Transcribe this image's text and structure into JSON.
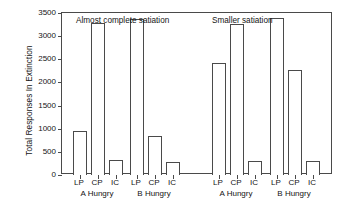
{
  "chart_data": {
    "type": "bar",
    "title": "",
    "xlabel": "",
    "ylabel": "Total Responses In Extinction",
    "ylim": [
      0,
      3500
    ],
    "yticks": [
      0,
      500,
      1000,
      1500,
      2000,
      2500,
      3000,
      3500
    ],
    "ytick_labels": [
      "0",
      "500",
      "1000",
      "1500",
      "2000",
      "2500",
      "3000",
      "3500"
    ],
    "grid": false,
    "legend": "none",
    "bar_style": "open-outline",
    "categories": [
      "LP",
      "CP",
      "IC"
    ],
    "panels": [
      {
        "annotation": "Almost complete satiation",
        "groups": [
          {
            "label": "A Hungry",
            "categories": [
              "LP",
              "CP",
              "IC"
            ],
            "values": [
              955,
              3290,
              325
            ]
          },
          {
            "label": "B Hungry",
            "categories": [
              "LP",
              "CP",
              "IC"
            ],
            "values": [
              3370,
              840,
              290
            ]
          }
        ]
      },
      {
        "annotation": "Smaller satiation",
        "groups": [
          {
            "label": "A Hungry",
            "categories": [
              "LP",
              "CP",
              "IC"
            ],
            "values": [
              2420,
              3270,
              300
            ]
          },
          {
            "label": "B Hungry",
            "categories": [
              "LP",
              "CP",
              "IC"
            ],
            "values": [
              3385,
              2270,
              300
            ]
          }
        ]
      }
    ],
    "colors": {
      "bar_edge": "#4a4a4a",
      "bar_fill": "#ffffff",
      "axis": "#4a4a4a",
      "text": "#141414",
      "background": "#ffffff"
    }
  }
}
